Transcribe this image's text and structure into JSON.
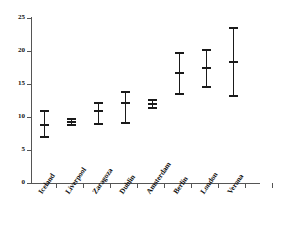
{
  "chart_data": {
    "type": "scatter",
    "title": "",
    "subtitle": "",
    "xlabel": "",
    "ylabel": "",
    "categories": [
      "Iceland",
      "Liverpool",
      "Zaragoza",
      "Dublin",
      "Amsterdam",
      "Berlin",
      "London",
      "Verona"
    ],
    "values": [
      8.8,
      9.2,
      10.9,
      12.1,
      12.0,
      16.6,
      17.4,
      18.4
    ],
    "error_low": [
      7.0,
      8.8,
      9.0,
      9.1,
      11.3,
      13.5,
      14.5,
      13.2
    ],
    "error_high": [
      11.0,
      9.8,
      12.3,
      14.0,
      12.7,
      19.8,
      20.3,
      23.7
    ],
    "series": [
      {
        "name": "mean with range",
        "points": [
          {
            "category": "Iceland",
            "mean": 8.8,
            "low": 7.0,
            "high": 11.0
          },
          {
            "category": "Liverpool",
            "mean": 9.2,
            "low": 8.8,
            "high": 9.8
          },
          {
            "category": "Zaragoza",
            "mean": 10.9,
            "low": 9.0,
            "high": 12.3
          },
          {
            "category": "Dublin",
            "mean": 12.1,
            "low": 9.1,
            "high": 14.0
          },
          {
            "category": "Amsterdam",
            "mean": 12.0,
            "low": 11.3,
            "high": 12.7
          },
          {
            "category": "Berlin",
            "mean": 16.6,
            "low": 13.5,
            "high": 19.8
          },
          {
            "category": "London",
            "mean": 17.4,
            "low": 14.5,
            "high": 20.3
          },
          {
            "category": "Verona",
            "mean": 18.4,
            "low": 13.2,
            "high": 23.7
          }
        ]
      }
    ],
    "ylim": [
      0,
      25
    ],
    "yticks": [
      0,
      5,
      10,
      15,
      20,
      25
    ],
    "ytick_labels": [
      "0",
      "5",
      "10",
      "15",
      "20",
      "25"
    ],
    "grid": false,
    "legend": false,
    "legend_position": "none",
    "marker_color": "#1a1a1a",
    "axis_color": "#555555",
    "background_color": "#ffffff"
  },
  "axes": {
    "y_ticks": [
      {
        "label": "25",
        "value": 25
      },
      {
        "label": "20",
        "value": 20
      },
      {
        "label": "15",
        "value": 15
      },
      {
        "label": "10",
        "value": 10
      },
      {
        "label": "5",
        "value": 5
      },
      {
        "label": "0",
        "value": 0
      }
    ],
    "x_categories": [
      {
        "label": "Iceland"
      },
      {
        "label": "Liverpool"
      },
      {
        "label": "Zaragoza"
      },
      {
        "label": "Dublin"
      },
      {
        "label": "Amsterdam"
      },
      {
        "label": "Berlin"
      },
      {
        "label": "London"
      },
      {
        "label": "Verona"
      }
    ]
  }
}
